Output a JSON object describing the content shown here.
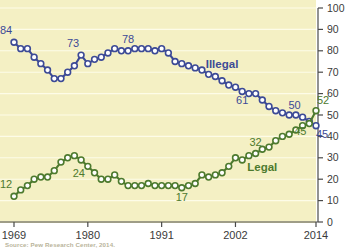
{
  "chart_data": {
    "type": "line",
    "title": "",
    "subtitle": "",
    "xlabel": "",
    "ylabel": "",
    "xlim": [
      1969,
      2014
    ],
    "ylim": [
      0,
      100
    ],
    "grid": true,
    "legend_position": "inline",
    "axis_side": "right",
    "background_color": "#f4f0c4",
    "x_tick_labels": [
      "1969",
      "1980",
      "1991",
      "2002",
      "2014"
    ],
    "x_tick_values": [
      1969,
      1980,
      1991,
      2002,
      2014
    ],
    "y_tick_labels": [
      "0",
      "10",
      "20",
      "30",
      "40",
      "50",
      "60",
      "70",
      "80",
      "90",
      "100"
    ],
    "y_tick_values": [
      0,
      10,
      20,
      30,
      40,
      50,
      60,
      70,
      80,
      90,
      100
    ],
    "x": [
      1969,
      1970,
      1971,
      1972,
      1973,
      1974,
      1975,
      1976,
      1977,
      1978,
      1979,
      1980,
      1981,
      1982,
      1983,
      1984,
      1985,
      1986,
      1987,
      1988,
      1989,
      1990,
      1991,
      1992,
      1993,
      1994,
      1995,
      1996,
      1997,
      1998,
      1999,
      2000,
      2001,
      2002,
      2003,
      2004,
      2005,
      2006,
      2007,
      2008,
      2009,
      2010,
      2011,
      2012,
      2013,
      2014
    ],
    "series": [
      {
        "name": "Illegal",
        "color": "#3c4a96",
        "marker_fill": "#ffffff",
        "label_color": "#3c4a96",
        "values": [
          84,
          81,
          81,
          77,
          74,
          71,
          67,
          67,
          70,
          73,
          78,
          74,
          76,
          77,
          79,
          81,
          80,
          80,
          81,
          81,
          81,
          80,
          81,
          79,
          75,
          74,
          73,
          72,
          71,
          69,
          68,
          66,
          64,
          63,
          61,
          60,
          60,
          57,
          54,
          52,
          51,
          50,
          50,
          49,
          47,
          45
        ],
        "point_labels": [
          {
            "x": 1969,
            "value": 84,
            "text": "84",
            "anchor": "above-left"
          },
          {
            "x": 1979,
            "value": 78,
            "text": "73",
            "anchor": "above-left"
          },
          {
            "x": 1986,
            "value": 80,
            "text": "78",
            "anchor": "above"
          },
          {
            "x": 2003,
            "value": 61,
            "text": "61",
            "anchor": "below"
          },
          {
            "x": 2012,
            "value": 49,
            "text": "50",
            "anchor": "above-left"
          },
          {
            "x": 2014,
            "value": 45,
            "text": "45",
            "anchor": "below-right"
          }
        ],
        "series_label": {
          "text": "Illegal",
          "x": 2000,
          "value": 72
        }
      },
      {
        "name": "Legal",
        "color": "#4d7a2e",
        "marker_fill": "#ffffff",
        "label_color": "#4d7a2e",
        "values": [
          12,
          15,
          17,
          20,
          21,
          21,
          24,
          28,
          30,
          31,
          29,
          26,
          23,
          20,
          20,
          22,
          19,
          17,
          17,
          17,
          18,
          17,
          17,
          17,
          17,
          16,
          17,
          18,
          22,
          21,
          22,
          23,
          26,
          30,
          29,
          31,
          32,
          34,
          35,
          38,
          40,
          41,
          43,
          45,
          46,
          52
        ],
        "point_labels": [
          {
            "x": 1969,
            "value": 12,
            "text": "12",
            "anchor": "above-left"
          },
          {
            "x": 1980,
            "value": 26,
            "text": "24",
            "anchor": "below-left"
          },
          {
            "x": 1994,
            "value": 16,
            "text": "17",
            "anchor": "below"
          },
          {
            "x": 2005,
            "value": 32,
            "text": "32",
            "anchor": "above"
          },
          {
            "x": 2013,
            "value": 46,
            "text": "45",
            "anchor": "below-left"
          },
          {
            "x": 2014,
            "value": 52,
            "text": "52",
            "anchor": "above-right"
          }
        ],
        "series_label": {
          "text": "Legal",
          "x": 2006,
          "value": 24
        }
      }
    ],
    "annotations": [
      {
        "text": "84",
        "series": "Illegal"
      },
      {
        "text": "73",
        "series": "Illegal"
      },
      {
        "text": "78",
        "series": "Illegal"
      },
      {
        "text": "61",
        "series": "Illegal"
      },
      {
        "text": "50",
        "series": "Illegal"
      },
      {
        "text": "45",
        "series": "Illegal"
      },
      {
        "text": "12",
        "series": "Legal"
      },
      {
        "text": "24",
        "series": "Legal"
      },
      {
        "text": "17",
        "series": "Legal"
      },
      {
        "text": "32",
        "series": "Legal"
      },
      {
        "text": "45",
        "series": "Legal"
      },
      {
        "text": "52",
        "series": "Legal"
      }
    ]
  },
  "footer": {
    "source": "Source: Pew Research Center, 2014."
  }
}
